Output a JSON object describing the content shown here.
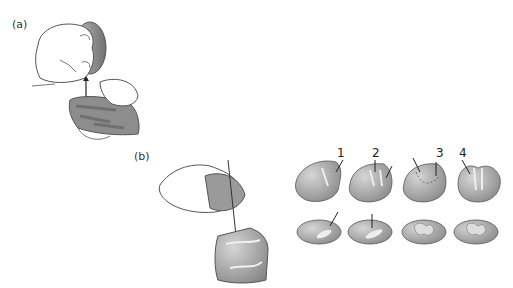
{
  "figure": {
    "panel_a": {
      "label": "(a)"
    },
    "panel_b": {
      "label": "(b)",
      "steps": [
        {
          "number": "1"
        },
        {
          "number": "2"
        },
        {
          "number": "3"
        },
        {
          "number": "4"
        }
      ]
    },
    "colors": {
      "stone": "#9a9a9a",
      "stone_dark": "#6f6f6f",
      "hand_outline": "#555555",
      "background": "#ffffff"
    }
  }
}
